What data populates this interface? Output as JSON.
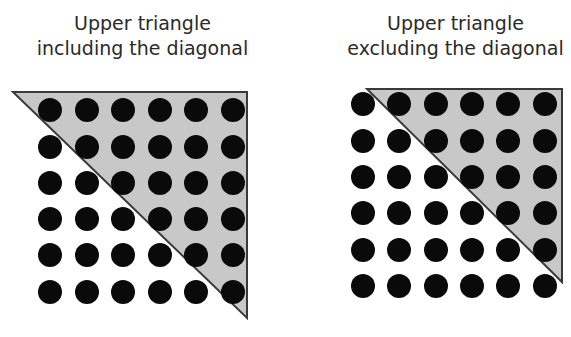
{
  "panels": [
    {
      "title_line1": "Upper triangle",
      "title_line2": "including the diagonal",
      "rows": 6,
      "cols": 6,
      "dot_x": [
        50,
        87,
        123,
        160,
        196,
        233
      ],
      "dot_y": [
        110,
        147,
        183,
        219,
        255,
        292
      ],
      "dot_radius": 12,
      "triangle": [
        [
          13,
          92
        ],
        [
          247,
          92
        ],
        [
          247,
          318
        ]
      ]
    },
    {
      "title_line1": "Upper triangle",
      "title_line2": "excluding the diagonal",
      "rows": 6,
      "cols": 6,
      "dot_x": [
        363,
        399,
        436,
        472,
        508,
        545
      ],
      "dot_y": [
        104,
        141,
        177,
        213,
        250,
        286
      ],
      "dot_radius": 12,
      "triangle": [
        [
          367,
          89
        ],
        [
          562,
          89
        ],
        [
          562,
          282
        ]
      ]
    }
  ],
  "colors": {
    "fill": "#c8c8c8",
    "stroke": "#3a3a3a",
    "dot": "#0a0a0a"
  }
}
